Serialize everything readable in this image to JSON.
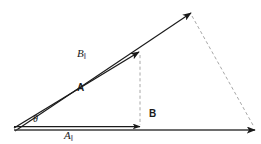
{
  "figure": {
    "type": "vector-decomposition-diagram",
    "background_color": "#ffffff",
    "stroke_color": "#1a1a1a",
    "guide_color": "#a8a8a8",
    "labels": {
      "b_parallel": "B",
      "b_parallel_subscript": "‖",
      "a_vector": "A",
      "a_parallel": "A",
      "a_parallel_subscript": "‖",
      "b_vector": "B",
      "theta": "θ"
    },
    "vectors": [
      {
        "name": "A",
        "label": "A",
        "style": "solid-arrow",
        "from": [
          14,
          128
        ],
        "to": [
          139,
          52
        ],
        "weight": 1.4
      },
      {
        "name": "B-parallel",
        "label": "B‖",
        "style": "solid-arrow",
        "from": [
          15,
          131
        ],
        "to": [
          191,
          13
        ],
        "weight": 1.2
      },
      {
        "name": "A-parallel",
        "label": "A‖",
        "style": "solid-arrow",
        "from": [
          14,
          127
        ],
        "to": [
          140,
          127
        ],
        "weight": 1.3
      },
      {
        "name": "B",
        "label": "B",
        "style": "solid-arrow",
        "from": [
          14,
          130
        ],
        "to": [
          255,
          130
        ],
        "weight": 1.6
      }
    ],
    "guides": [
      {
        "name": "vertical-projection-dashed",
        "style": "dashed",
        "from": [
          140,
          54
        ],
        "to": [
          140,
          126
        ]
      },
      {
        "name": "closing-side-dashed",
        "style": "dashed",
        "from": [
          192,
          15
        ],
        "to": [
          254,
          126
        ]
      }
    ]
  }
}
